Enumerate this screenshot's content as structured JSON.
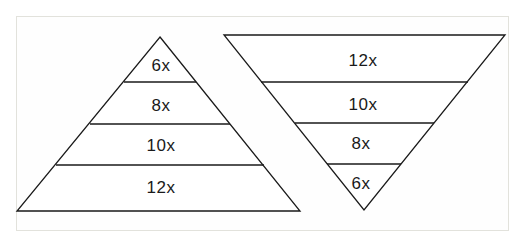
{
  "diagram": {
    "type": "pyramid-comparison",
    "pyramid": {
      "orientation": "upright",
      "layers": [
        {
          "label": "6x"
        },
        {
          "label": "8x"
        },
        {
          "label": "10x"
        },
        {
          "label": "12x"
        }
      ]
    },
    "inverted_pyramid": {
      "orientation": "inverted",
      "layers": [
        {
          "label": "12x"
        },
        {
          "label": "10x"
        },
        {
          "label": "8x"
        },
        {
          "label": "6x"
        }
      ]
    },
    "colors": {
      "stroke": "#1a1a1a",
      "fill": "#ffffff",
      "frame": "#e2e2dc"
    }
  }
}
